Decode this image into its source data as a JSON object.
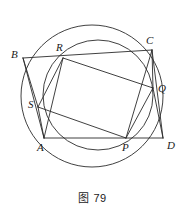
{
  "figure": {
    "caption": "图 79",
    "stroke_color": "#2b2b2b",
    "label_color": "#1a1a1a",
    "background": "#ffffff"
  },
  "circles": [
    {
      "name": "outer-circle",
      "through": [
        "B",
        "C",
        "D",
        "A"
      ],
      "cx": 92,
      "cy": 96,
      "r": 71
    },
    {
      "name": "inner-circle",
      "through": [
        "R",
        "Q",
        "P",
        "S"
      ],
      "cx": 98,
      "cy": 95,
      "r": 55
    }
  ],
  "points": [
    {
      "id": "B",
      "label": "B",
      "x": 23,
      "y": 58,
      "label_x": 11,
      "label_y": 49
    },
    {
      "id": "R",
      "label": "R",
      "x": 63,
      "y": 58,
      "label_x": 56,
      "label_y": 42
    },
    {
      "id": "C",
      "label": "C",
      "x": 152,
      "y": 50,
      "label_x": 146,
      "label_y": 35
    },
    {
      "id": "Q",
      "label": "Q",
      "x": 153,
      "y": 88,
      "label_x": 158,
      "label_y": 83
    },
    {
      "id": "S",
      "label": "S",
      "x": 38,
      "y": 107,
      "label_x": 28,
      "label_y": 99
    },
    {
      "id": "A",
      "label": "A",
      "x": 44,
      "y": 138,
      "label_x": 37,
      "label_y": 142
    },
    {
      "id": "P",
      "label": "P",
      "x": 126,
      "y": 138,
      "label_x": 122,
      "label_y": 142
    },
    {
      "id": "D",
      "label": "D",
      "x": 163,
      "y": 138,
      "label_x": 167,
      "label_y": 140
    }
  ],
  "segments": [
    {
      "name": "segment-B-C",
      "from": "B",
      "to": "C"
    },
    {
      "name": "segment-B-S",
      "from": "B",
      "to": "S"
    },
    {
      "name": "segment-B-A",
      "from": "B",
      "to": "A"
    },
    {
      "name": "segment-A-D",
      "from": "A",
      "to": "D"
    },
    {
      "name": "segment-C-D",
      "from": "C",
      "to": "D"
    },
    {
      "name": "segment-C-Q",
      "from": "C",
      "to": "Q"
    },
    {
      "name": "segment-R-S",
      "from": "R",
      "to": "S"
    },
    {
      "name": "segment-R-Q",
      "from": "R",
      "to": "Q"
    },
    {
      "name": "segment-R-A",
      "from": "R",
      "to": "A"
    },
    {
      "name": "segment-S-P",
      "from": "S",
      "to": "P"
    },
    {
      "name": "segment-S-A",
      "from": "S",
      "to": "A"
    },
    {
      "name": "segment-P-Q",
      "from": "P",
      "to": "Q"
    },
    {
      "name": "segment-P-C",
      "from": "P",
      "to": "C"
    },
    {
      "name": "segment-Q-D",
      "from": "Q",
      "to": "D"
    }
  ]
}
